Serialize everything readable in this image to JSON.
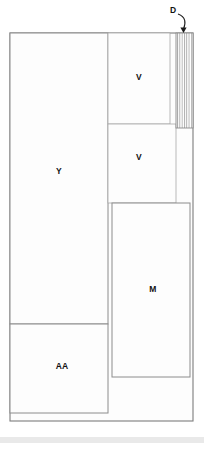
{
  "diagram": {
    "type": "floor-plan",
    "title": "",
    "canvas": {
      "width": 204,
      "height": 449
    },
    "background_color": "#ffffff",
    "line_color": "#8c8c8c",
    "label_color": "#121212",
    "rooms": [
      {
        "id": "room-y",
        "label": "Y",
        "x": 10,
        "y": 33,
        "width": 98,
        "height": 291,
        "label_x": 59,
        "label_y": 172
      },
      {
        "id": "room-v-upper",
        "label": "V",
        "x": 108,
        "y": 33,
        "width": 62,
        "height": 91,
        "label_x": 139,
        "label_y": 78
      },
      {
        "id": "room-v-lower",
        "label": "V",
        "x": 108,
        "y": 124,
        "width": 68,
        "height": 79,
        "label_x": 139,
        "label_y": 158
      },
      {
        "id": "room-m",
        "label": "M",
        "x": 112,
        "y": 203,
        "width": 78,
        "height": 174,
        "label_x": 153,
        "label_y": 290
      },
      {
        "id": "room-aa",
        "label": "AA",
        "x": 10,
        "y": 324,
        "width": 98,
        "height": 89,
        "label_x": 62,
        "label_y": 367
      }
    ],
    "hatched_region": {
      "id": "hatch-d",
      "x": 176,
      "y": 33,
      "width": 17,
      "height": 95,
      "stripe_count": 8,
      "stripe_color": "#8a8a8a"
    },
    "callout": {
      "label": "D",
      "label_x": 173,
      "label_y": 11,
      "arrow_start_x": 178,
      "arrow_start_y": 14,
      "arrow_end_x": 183,
      "arrow_end_y": 32
    },
    "outer_boundary": {
      "x": 10,
      "y": 33,
      "width": 183,
      "height": 388
    },
    "footer_band": {
      "y": 437,
      "height": 6,
      "color": "#e9e9e9"
    }
  }
}
